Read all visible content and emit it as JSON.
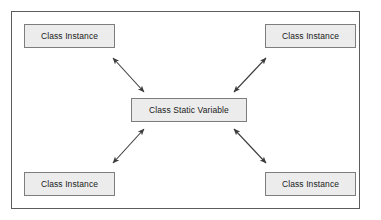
{
  "diagram": {
    "frame": {
      "border_color": "#5c5c5c",
      "background_color": "#ffffff"
    },
    "node_style": {
      "fill_color": "#ececec",
      "border_color": "#7d7d7d",
      "text_color": "#1a1a1a"
    },
    "arrow_style": {
      "color": "#3c3c3c",
      "heads": "double"
    },
    "nodes": [
      {
        "id": "top-left",
        "label": "Class Instance"
      },
      {
        "id": "top-right",
        "label": "Class Instance"
      },
      {
        "id": "center",
        "label": "Class Static Variable"
      },
      {
        "id": "bottom-left",
        "label": "Class Instance"
      },
      {
        "id": "bottom-right",
        "label": "Class Instance"
      }
    ],
    "connections": [
      {
        "from": "top-left",
        "to": "center",
        "type": "double-arrow"
      },
      {
        "from": "top-right",
        "to": "center",
        "type": "double-arrow"
      },
      {
        "from": "bottom-left",
        "to": "center",
        "type": "double-arrow"
      },
      {
        "from": "bottom-right",
        "to": "center",
        "type": "double-arrow"
      }
    ]
  }
}
